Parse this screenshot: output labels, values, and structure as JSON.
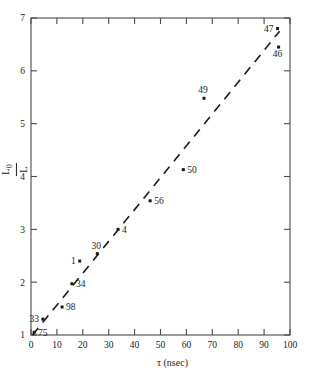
{
  "chart_data": {
    "type": "scatter",
    "title": "",
    "xlabel": "τ (nsec)",
    "ylabel_numerator": "L",
    "ylabel_numerator_sub": "0",
    "ylabel_denominator": "L",
    "ylabel": "L0/L",
    "xlim": [
      0,
      100
    ],
    "ylim": [
      1,
      7
    ],
    "xticks": [
      0,
      10,
      20,
      30,
      40,
      50,
      60,
      70,
      80,
      90,
      100
    ],
    "xticklabels": [
      "0",
      "10",
      "20",
      "30",
      "40",
      "50",
      "60",
      "70",
      "80",
      "90",
      "100"
    ],
    "yticks": [
      1,
      2,
      3,
      4,
      5,
      6,
      7
    ],
    "yticklabels": [
      "1",
      "2",
      "3",
      "4",
      "5",
      "6",
      "7"
    ],
    "grid": false,
    "legend": false,
    "marker_color": "#1a1a1a",
    "line_color": "#1a1a1a",
    "axis_color": "#4a4a4a",
    "points": [
      {
        "label": "75",
        "x": 1.2,
        "y": 1.05,
        "label_pos": "right"
      },
      {
        "label": "33",
        "x": 4.6,
        "y": 1.3,
        "label_pos": "left"
      },
      {
        "label": "98",
        "x": 12.0,
        "y": 1.53,
        "label_pos": "right"
      },
      {
        "label": "34",
        "x": 15.8,
        "y": 1.97,
        "label_pos": "right"
      },
      {
        "label": "1",
        "x": 18.8,
        "y": 2.4,
        "label_pos": "left"
      },
      {
        "label": "30",
        "x": 25.6,
        "y": 2.54,
        "label_pos": "above"
      },
      {
        "label": "4",
        "x": 33.6,
        "y": 3.0,
        "label_pos": "right"
      },
      {
        "label": "56",
        "x": 46.0,
        "y": 3.54,
        "label_pos": "right"
      },
      {
        "label": "50",
        "x": 58.8,
        "y": 4.13,
        "label_pos": "right"
      },
      {
        "label": "49",
        "x": 66.8,
        "y": 5.48,
        "label_pos": "above"
      },
      {
        "label": "46",
        "x": 95.6,
        "y": 6.45,
        "label_pos": "below"
      },
      {
        "label": "47",
        "x": 95.2,
        "y": 6.8,
        "label_pos": "left"
      }
    ],
    "fit_line": {
      "style": "dashed",
      "x_start": 0.6,
      "y_start": 1.0,
      "x_end": 96.0,
      "y_end": 6.75
    }
  }
}
